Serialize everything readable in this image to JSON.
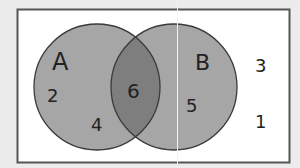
{
  "diagram": {
    "type": "venn",
    "universal_set": {
      "elements_outside": [
        "3",
        "1"
      ]
    },
    "sets": [
      {
        "name": "A",
        "only_elements": [
          "2",
          "4"
        ]
      },
      {
        "name": "B",
        "only_elements": [
          "5"
        ]
      }
    ],
    "intersection": {
      "elements": [
        "6"
      ]
    },
    "labels": {
      "set_a": "A",
      "set_b": "B",
      "a_only_1": "2",
      "a_only_2": "4",
      "a_and_b": "6",
      "b_only": "5",
      "outside_1": "3",
      "outside_2": "1"
    },
    "colors": {
      "background": "#ececec",
      "box_fill": "#ffffff",
      "box_stroke": "#555555",
      "circle_fill": "#a6a6a6",
      "intersection_fill": "#7e7e7e",
      "circle_stroke": "#3a3a3a"
    }
  }
}
